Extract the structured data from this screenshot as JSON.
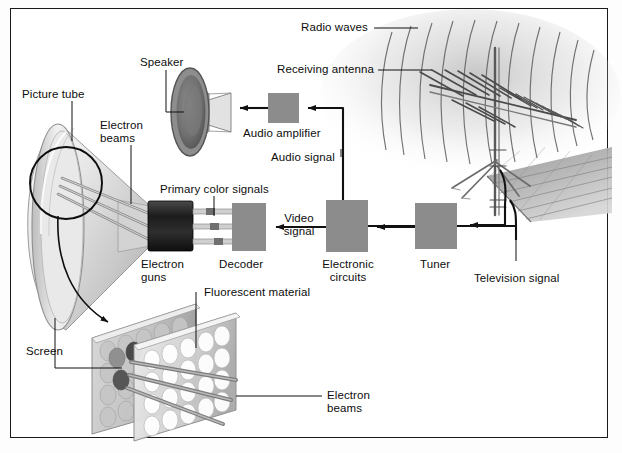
{
  "figure": {
    "kind": "technical-illustration",
    "frame_color": "#1a1a1a",
    "background": "#ffffff",
    "block_fill": "#8c8c8c"
  },
  "labels": {
    "picture_tube": "Picture tube",
    "electron_beams_top": "Electron\nbeams",
    "speaker": "Speaker",
    "radio_waves": "Radio waves",
    "receiving_antenna": "Receiving antenna",
    "audio_amplifier": "Audio amplifier",
    "audio_signal": "Audio signal",
    "primary_color_signals": "Primary color signals",
    "electron_guns": "Electron\nguns",
    "decoder": "Decoder",
    "video_signal": "Video\nsignal",
    "electronic_circuits": "Electronic\ncircuits",
    "tuner": "Tuner",
    "television_signal": "Television signal",
    "fluorescent_material": "Fluorescent material",
    "screen": "Screen",
    "electron_beams_bottom": "Electron\nbeams"
  },
  "blocks": [
    {
      "name": "audio-amplifier",
      "label": "Audio amplifier",
      "x": 268,
      "y": 93,
      "w": 31,
      "h": 30
    },
    {
      "name": "decoder",
      "label": "Decoder",
      "x": 232,
      "y": 203,
      "w": 34,
      "h": 48
    },
    {
      "name": "electronic-circuits",
      "label": "Electronic circuits",
      "x": 326,
      "y": 200,
      "w": 42,
      "h": 52
    },
    {
      "name": "tuner",
      "label": "Tuner",
      "x": 415,
      "y": 203,
      "w": 42,
      "h": 46
    }
  ],
  "signal_flow": [
    {
      "from": "antenna",
      "to": "tuner",
      "signal": "Television signal"
    },
    {
      "from": "antenna",
      "to": "audio-amplifier",
      "signal": "Audio signal"
    },
    {
      "from": "audio-amplifier",
      "to": "speaker",
      "signal": "Audio signal"
    },
    {
      "from": "tuner",
      "to": "electronic-circuits",
      "signal": "Television signal"
    },
    {
      "from": "electronic-circuits",
      "to": "decoder",
      "signal": "Video signal"
    },
    {
      "from": "decoder",
      "to": "electron-guns",
      "signal": "Primary color signals"
    }
  ]
}
